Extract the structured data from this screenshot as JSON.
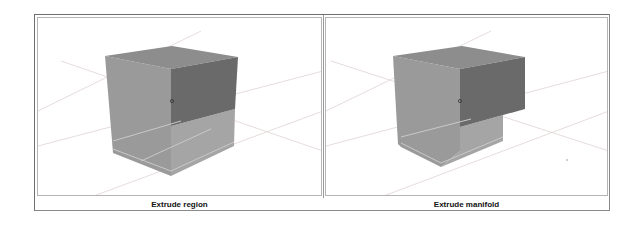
{
  "panels": [
    {
      "id": "left",
      "caption": "Extrude region",
      "colors": {
        "top_face": "#8c8c8c",
        "left_face": "#9a9a9a",
        "extruded_face": "#6b6b6b",
        "lower_right_face": "#a3a3a3",
        "bottom_face": "#b0b0b0",
        "grid_line": "#e3dede"
      }
    },
    {
      "id": "right",
      "caption": "Extrude manifold",
      "colors": {
        "top_face": "#8c8c8c",
        "left_face": "#9a9a9a",
        "extruded_face": "#6b6b6b",
        "lower_right_face": "#a3a3a3",
        "bottom_face": "#b0b0b0",
        "grid_line": "#e3dede"
      }
    }
  ]
}
